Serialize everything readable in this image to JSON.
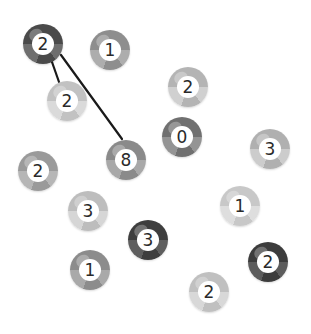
{
  "puzzle": {
    "type": "bridges",
    "width": 311,
    "height": 334,
    "background": "#ffffff",
    "bridge_color": "#1a1a1a",
    "islands": [
      {
        "id": 0,
        "number": "2",
        "x": 43,
        "y": 44,
        "shade": "#4a4a4a",
        "shade_light": "#6e6e6e"
      },
      {
        "id": 1,
        "number": "1",
        "x": 110,
        "y": 50,
        "shade": "#8e8e8e",
        "shade_light": "#adadad"
      },
      {
        "id": 2,
        "number": "2",
        "x": 67,
        "y": 101,
        "shade": "#c2c2c2",
        "shade_light": "#dadada"
      },
      {
        "id": 3,
        "number": "2",
        "x": 188,
        "y": 87,
        "shade": "#b4b4b4",
        "shade_light": "#d0d0d0"
      },
      {
        "id": 4,
        "number": "0",
        "x": 182,
        "y": 137,
        "shade": "#707070",
        "shade_light": "#949494"
      },
      {
        "id": 5,
        "number": "8",
        "x": 126,
        "y": 160,
        "shade": "#8a8a8a",
        "shade_light": "#a8a8a8"
      },
      {
        "id": 6,
        "number": "3",
        "x": 270,
        "y": 149,
        "shade": "#b0b0b0",
        "shade_light": "#cccccc"
      },
      {
        "id": 7,
        "number": "2",
        "x": 38,
        "y": 171,
        "shade": "#9a9a9a",
        "shade_light": "#b6b6b6"
      },
      {
        "id": 8,
        "number": "3",
        "x": 88,
        "y": 211,
        "shade": "#bdbdbd",
        "shade_light": "#d6d6d6"
      },
      {
        "id": 9,
        "number": "1",
        "x": 240,
        "y": 206,
        "shade": "#c8c8c8",
        "shade_light": "#dedede"
      },
      {
        "id": 10,
        "number": "3",
        "x": 148,
        "y": 240,
        "shade": "#3e3e3e",
        "shade_light": "#5e5e5e"
      },
      {
        "id": 11,
        "number": "1",
        "x": 90,
        "y": 270,
        "shade": "#8c8c8c",
        "shade_light": "#a9a9a9"
      },
      {
        "id": 12,
        "number": "2",
        "x": 268,
        "y": 262,
        "shade": "#3c3c3c",
        "shade_light": "#5c5c5c"
      },
      {
        "id": 13,
        "number": "2",
        "x": 209,
        "y": 292,
        "shade": "#c0c0c0",
        "shade_light": "#d8d8d8"
      }
    ],
    "bridges": [
      {
        "from": 0,
        "to": 2,
        "x1": 52,
        "y1": 62,
        "x2": 59,
        "y2": 82
      },
      {
        "from": 0,
        "to": 5,
        "x1": 61,
        "y1": 55,
        "x2": 122,
        "y2": 139
      }
    ]
  }
}
